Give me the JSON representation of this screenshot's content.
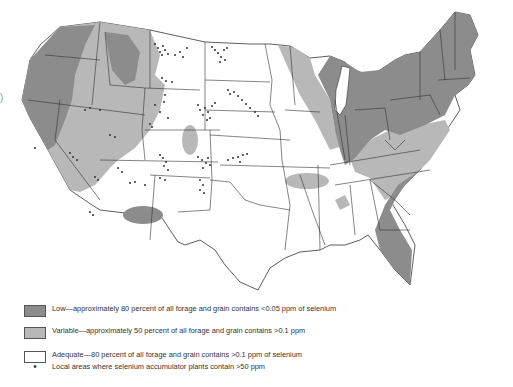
{
  "figure": {
    "title": "",
    "colors": {
      "low": "#8c8c8c",
      "variable": "#b8b8b8",
      "adequate": "#ffffff",
      "border": "#333333",
      "dot": "#333333"
    }
  },
  "legend": {
    "items": [
      {
        "key": "low",
        "label": "Low—approximately 80 percent of all forage and grain contains <0.05 ppm of selenium"
      },
      {
        "key": "variable",
        "label": "Variable—approximately 50 percent of all forage and grain contains >0.1 ppm"
      },
      {
        "key": "adequate",
        "label": "Adequate—80 percent of all forage and grain contains >0.1 ppm of selenium"
      },
      {
        "key": "accumulator",
        "label": "Local areas where selenium accumulator plants contain >50 ppm",
        "symbol": "•"
      }
    ]
  },
  "edge_mark": ")"
}
